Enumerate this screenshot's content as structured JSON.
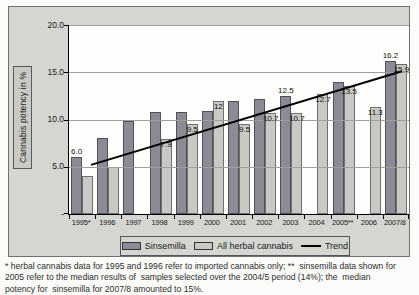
{
  "chart": {
    "y_axis_title": "Cannabis potency in %",
    "y_ticks": [
      {
        "label": "20.0",
        "value": 20
      },
      {
        "label": "15.0",
        "value": 15
      },
      {
        "label": "10.0",
        "value": 10
      },
      {
        "label": "5.0",
        "value": 5
      },
      {
        "label": "-",
        "value": 0
      }
    ],
    "legend": [
      {
        "label": "Sinsemilla",
        "type": "box",
        "color": "#8b8b95"
      },
      {
        "label": "All herbal cannabis",
        "type": "box",
        "color": "#c8c8c5"
      },
      {
        "label": "Trend",
        "type": "line",
        "color": "#000000"
      }
    ],
    "colors": {
      "sinsemilla": "#8b8b95",
      "all_herbal": "#c8c8c5",
      "trend": "#000000",
      "chart_background": "#d5d5d1",
      "plot_background": "#fefefc"
    }
  },
  "chart_data": {
    "type": "bar",
    "title": "",
    "xlabel": "",
    "ylabel": "Cannabis potency in %",
    "ylim": [
      0,
      20
    ],
    "grid": true,
    "gridline_values": [
      5,
      10,
      15,
      20
    ],
    "legend_position": "bottom",
    "categories": [
      "1995*",
      "1996",
      "1997",
      "1998",
      "1999",
      "2000",
      "2001",
      "2002",
      "2003",
      "2004",
      "2005**",
      "2006",
      "2007/8"
    ],
    "series": [
      {
        "name": "Sinsemilla",
        "color": "#8b8b95",
        "values": [
          6.0,
          8.0,
          9.8,
          10.8,
          10.8,
          10.9,
          12.0,
          12.2,
          12.5,
          null,
          14.0,
          null,
          16.2
        ],
        "labels": [
          "6.0",
          null,
          null,
          null,
          null,
          null,
          null,
          null,
          "12.5",
          null,
          null,
          null,
          "16.2"
        ],
        "label_position": "above"
      },
      {
        "name": "All herbal cannabis",
        "color": "#c8c8c5",
        "values": [
          4.0,
          5.0,
          null,
          7.9,
          9.5,
          12.0,
          9.5,
          10.7,
          10.7,
          12.7,
          13.5,
          11.3,
          15.9
        ],
        "labels": [
          null,
          null,
          null,
          "7.9",
          "9.5",
          "12",
          "9.5",
          "10.7",
          "10.7",
          "12.7",
          "13.5",
          "11.3",
          "15.9"
        ],
        "label_position": "inside"
      }
    ],
    "trend": {
      "name": "Trend",
      "start_category": "1995*",
      "start_value": 5.2,
      "end_category": "2007/8",
      "end_value": 15.1
    }
  },
  "footnote": {
    "lines": [
      "* herbal cannabis data for 1995 and 1996 refer to imported cannabis only; **  sinsemilla data shown for",
      "2005 refer to the median results of  samples selected over the 2004/5 period (14%); the  median",
      "potency for  sinsemilla for 2007/8 amounted to 15%."
    ]
  }
}
